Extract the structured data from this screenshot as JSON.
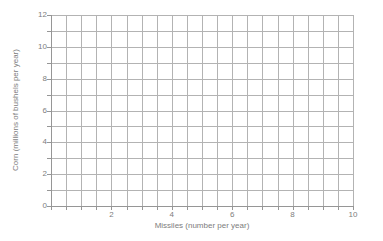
{
  "chart_data": {
    "type": "grid",
    "title": "",
    "xlabel": "Missiles (number per year)",
    "ylabel": "Corn (millions of bushels per year)",
    "xlim": [
      0,
      10
    ],
    "ylim": [
      0,
      12
    ],
    "x_tick_labels": [
      2,
      4,
      6,
      8,
      10
    ],
    "y_tick_labels": [
      0,
      2,
      4,
      6,
      8,
      10,
      12
    ],
    "x_grid_step": 0.5,
    "y_grid_step": 1,
    "grid": true,
    "legend": false,
    "series": [],
    "colors": {
      "grid_color": "#b3b3b3",
      "axis_color": "#969696",
      "label_color": "#7d7d7d",
      "background": "#ffffff"
    }
  }
}
